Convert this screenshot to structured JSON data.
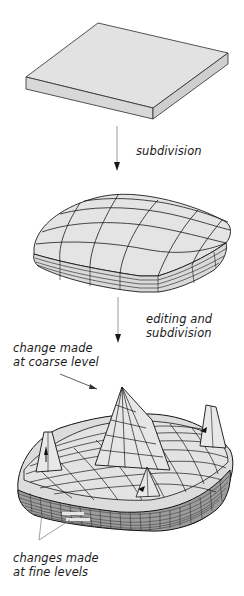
{
  "figure": {
    "stages": [
      {
        "id": "base",
        "description": "flat slab (control mesh)"
      },
      {
        "id": "subdivided",
        "description": "smooth subdivided mesh"
      },
      {
        "id": "edited",
        "description": "edited and subdivided mesh with peaks"
      }
    ],
    "arrows": [
      {
        "label": "subdivision"
      },
      {
        "label_line1": "editing and",
        "label_line2": "subdivision"
      }
    ],
    "annotations": {
      "coarse": {
        "line1": "change made",
        "line2": "at coarse level"
      },
      "fine": {
        "line1": "changes made",
        "line2": "at fine levels"
      }
    },
    "colors": {
      "surface": "#e2e2e2",
      "side": "#d6d6d6",
      "edge": "#1a1a1a",
      "arrow": "#9a9a9a",
      "text": "#1a1a1a"
    }
  }
}
